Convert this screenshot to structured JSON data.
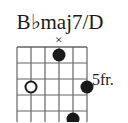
{
  "chord": {
    "title": "B♭maj7/D",
    "position_label": "5fr.",
    "instrument": "guitar",
    "string_count": 6,
    "fret_rows": 5,
    "base_fret": 5,
    "ink_color": "#1a1a1a",
    "grid_color": "#666666",
    "background": "#ffffff"
  },
  "markers": {
    "mute": [
      {
        "label": "×",
        "string": 4
      }
    ],
    "open_dots": [
      {
        "string": 2,
        "fret": 3
      }
    ],
    "filled_dots": [
      {
        "string": 4,
        "fret": 1
      },
      {
        "string": 6,
        "fret": 3
      },
      {
        "string": 5,
        "fret": 5
      }
    ]
  },
  "geometry": {
    "grid_left": 17,
    "grid_top": 47,
    "string_spacing": 14,
    "fret_spacing": 16,
    "dot_radius": 6.5,
    "open_radius": 5.5
  }
}
